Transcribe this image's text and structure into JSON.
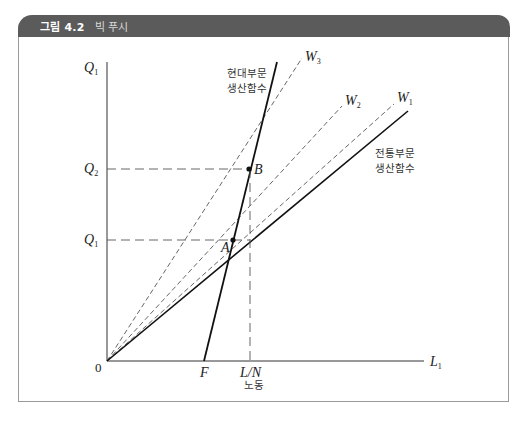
{
  "figure": {
    "number": "그림 4.2",
    "title": "빅 푸시"
  },
  "axes": {
    "y_label": "Q",
    "y_label_sub": "1",
    "x_label": "L",
    "x_label_sub": "1",
    "origin": "0",
    "x_axis_caption": "노동"
  },
  "ticks": {
    "q2": "Q",
    "q2_sub": "2",
    "q1": "Q",
    "q1_sub": "1",
    "f": "F",
    "ln": "L/N"
  },
  "points": {
    "a": "A",
    "b": "B"
  },
  "wage_lines": [
    {
      "label": "W",
      "sub": "3"
    },
    {
      "label": "W",
      "sub": "2"
    },
    {
      "label": "W",
      "sub": "1"
    }
  ],
  "curves": {
    "modern_line1": "현대부문",
    "modern_line2": "생산함수",
    "traditional_line1": "전통부문",
    "traditional_line2": "생산함수"
  },
  "colors": {
    "header_bg": "#5b5b5b",
    "line": "#111111",
    "dashed": "#555555"
  }
}
